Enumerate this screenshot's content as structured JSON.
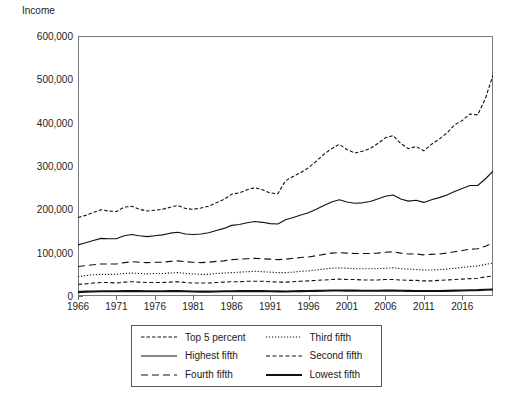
{
  "chart_data": {
    "type": "line",
    "title": "",
    "subtitle": "",
    "ylabel": "Income",
    "xlabel": "",
    "ylim": [
      0,
      600000
    ],
    "xlim": [
      1966,
      2020
    ],
    "grid": false,
    "legend_position": "bottom",
    "ytick_labels": [
      "600,000",
      "500,000",
      "400,000",
      "300,000",
      "200,000",
      "100,000",
      "0"
    ],
    "ytick_values": [
      600000,
      500000,
      400000,
      300000,
      200000,
      100000,
      0
    ],
    "xtick_labels": [
      "1966",
      "1971",
      "1976",
      "1981",
      "1986",
      "1991",
      "1996",
      "2001",
      "2006",
      "2011",
      "2016"
    ],
    "xtick_values": [
      1966,
      1971,
      1976,
      1981,
      1986,
      1991,
      1996,
      2001,
      2006,
      2011,
      2016
    ],
    "x": [
      1966,
      1967,
      1968,
      1969,
      1970,
      1971,
      1972,
      1973,
      1974,
      1975,
      1976,
      1977,
      1978,
      1979,
      1980,
      1981,
      1982,
      1983,
      1984,
      1985,
      1986,
      1987,
      1988,
      1989,
      1990,
      1991,
      1992,
      1993,
      1994,
      1995,
      1996,
      1997,
      1998,
      1999,
      2000,
      2001,
      2002,
      2003,
      2004,
      2005,
      2006,
      2007,
      2008,
      2009,
      2010,
      2011,
      2012,
      2013,
      2014,
      2015,
      2016,
      2017,
      2018,
      2019,
      2020
    ],
    "series": [
      {
        "name": "Top 5 percent",
        "style": "fine-dash",
        "width": 1.1,
        "color": "#111111",
        "values": [
          181000,
          186000,
          193000,
          199000,
          196000,
          195000,
          205000,
          207000,
          200000,
          196000,
          198000,
          200000,
          205000,
          209000,
          202000,
          200000,
          203000,
          207000,
          215000,
          223000,
          235000,
          238000,
          245000,
          250000,
          245000,
          238000,
          236000,
          266000,
          276000,
          285000,
          296000,
          311000,
          327000,
          340000,
          350000,
          338000,
          330000,
          334000,
          340000,
          352000,
          365000,
          370000,
          352000,
          340000,
          345000,
          335000,
          350000,
          362000,
          376000,
          395000,
          405000,
          420000,
          418000,
          455000,
          510000
        ]
      },
      {
        "name": "Highest fifth",
        "style": "solid-thin",
        "width": 1.1,
        "color": "#111111",
        "values": [
          118000,
          123000,
          128000,
          133000,
          132000,
          132000,
          139000,
          142000,
          139000,
          137000,
          139000,
          141000,
          145000,
          147000,
          143000,
          142000,
          143000,
          146000,
          151000,
          156000,
          163000,
          165000,
          169000,
          172000,
          170000,
          167000,
          166000,
          176000,
          181000,
          187000,
          192000,
          200000,
          209000,
          217000,
          222000,
          217000,
          214000,
          215000,
          218000,
          224000,
          230000,
          233000,
          224000,
          219000,
          221000,
          216000,
          222000,
          227000,
          233000,
          241000,
          248000,
          255000,
          255000,
          270000,
          288000
        ]
      },
      {
        "name": "Fourth fifth",
        "style": "long-dash",
        "width": 1.1,
        "color": "#111111",
        "values": [
          68000,
          70000,
          72000,
          74000,
          74000,
          74000,
          77000,
          79000,
          78000,
          77000,
          78000,
          78000,
          80000,
          81000,
          79000,
          78000,
          77000,
          78000,
          80000,
          81000,
          84000,
          85000,
          86000,
          87000,
          86000,
          85000,
          84000,
          85000,
          87000,
          89000,
          90000,
          93000,
          96000,
          99000,
          100000,
          99000,
          98000,
          98000,
          98000,
          99000,
          101000,
          102000,
          99000,
          97000,
          97000,
          95000,
          96000,
          97000,
          99000,
          102000,
          105000,
          108000,
          109000,
          115000,
          122000
        ]
      },
      {
        "name": "Third fifth",
        "style": "dotted",
        "width": 1.1,
        "color": "#111111",
        "values": [
          45000,
          47000,
          49000,
          50000,
          50000,
          50000,
          52000,
          53000,
          52000,
          51000,
          52000,
          52000,
          53000,
          54000,
          52000,
          51000,
          50000,
          50000,
          52000,
          53000,
          54000,
          55000,
          56000,
          57000,
          56000,
          55000,
          54000,
          54000,
          55000,
          57000,
          58000,
          60000,
          62000,
          64000,
          65000,
          64000,
          63000,
          63000,
          63000,
          63000,
          64000,
          65000,
          63000,
          62000,
          61000,
          60000,
          60000,
          61000,
          62000,
          64000,
          66000,
          68000,
          69000,
          73000,
          76000
        ]
      },
      {
        "name": "Second fifth",
        "style": "dash-dot",
        "width": 1.1,
        "color": "#111111",
        "values": [
          27000,
          28000,
          30000,
          31000,
          31000,
          30000,
          32000,
          33000,
          32000,
          31000,
          31000,
          31000,
          32000,
          33000,
          31000,
          30000,
          30000,
          30000,
          31000,
          32000,
          33000,
          33000,
          34000,
          34000,
          34000,
          33000,
          32000,
          32000,
          33000,
          34000,
          35000,
          36000,
          37000,
          38000,
          39000,
          38000,
          38000,
          37000,
          37000,
          37000,
          38000,
          38000,
          37000,
          36000,
          36000,
          35000,
          35000,
          36000,
          37000,
          38000,
          39000,
          40000,
          41000,
          44000,
          46000
        ]
      },
      {
        "name": "Lowest fifth",
        "style": "solid-thick",
        "width": 2.1,
        "color": "#111111",
        "values": [
          9000,
          10000,
          10500,
          11000,
          11000,
          10800,
          11200,
          11500,
          11200,
          10800,
          11000,
          11000,
          11200,
          11300,
          10800,
          10400,
          10200,
          10200,
          10500,
          10800,
          11000,
          11200,
          11300,
          11500,
          11200,
          10800,
          10600,
          10500,
          10800,
          11200,
          11400,
          11800,
          12200,
          12600,
          12800,
          12500,
          12300,
          12200,
          12100,
          12100,
          12300,
          12500,
          12000,
          11800,
          11700,
          11400,
          11500,
          11700,
          11900,
          12400,
          12800,
          13200,
          13500,
          14500,
          15000
        ]
      }
    ]
  },
  "legend": {
    "items": [
      {
        "label": "Top 5 percent",
        "style": "fine-dash"
      },
      {
        "label": "Third fifth",
        "style": "dotted"
      },
      {
        "label": "Highest fifth",
        "style": "solid-thin"
      },
      {
        "label": "Second fifth",
        "style": "dash-dot"
      },
      {
        "label": "Fourth fifth",
        "style": "long-dash"
      },
      {
        "label": "Lowest fifth",
        "style": "solid-thick"
      }
    ]
  },
  "colors": {
    "ink": "#111111",
    "axis": "#7a7a7a",
    "background": "#ffffff"
  }
}
